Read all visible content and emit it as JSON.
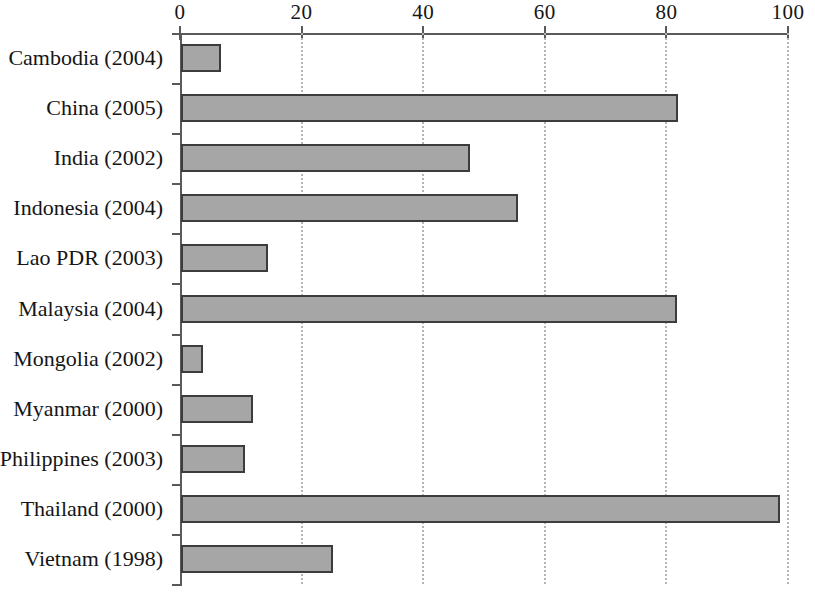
{
  "chart_data": {
    "type": "bar",
    "orientation": "horizontal",
    "title": "",
    "subtitle": "",
    "xlabel": "",
    "ylabel": "",
    "xlim": [
      0,
      100
    ],
    "ylim": null,
    "grid": true,
    "grid_axis": "x",
    "grid_style": "dotted",
    "legend": false,
    "legend_position": "none",
    "axis_position": "top",
    "xticks": [
      0,
      20,
      40,
      60,
      80,
      100
    ],
    "xtick_labels": [
      "0",
      "20",
      "40",
      "60",
      "80",
      "100"
    ],
    "categories": [
      "Cambodia (2004)",
      "China (2005)",
      "India (2002)",
      "Indonesia (2004)",
      "Lao PDR (2003)",
      "Malaysia (2004)",
      "Mongolia (2002)",
      "Myanmar (2000)",
      "Philippines (2003)",
      "Thailand (2000)",
      "Vietnam (1998)"
    ],
    "values": [
      6.6,
      81.8,
      47.6,
      55.5,
      14.3,
      81.6,
      3.6,
      11.8,
      10.5,
      98.6,
      25.0
    ],
    "colors": {
      "bar_fill": "#a6a6a6",
      "bar_border": "#3c3c3c",
      "axis": "#5a5a5a",
      "gridline": "#b4b4b4",
      "text": "#151515",
      "background": "#ffffff"
    }
  }
}
